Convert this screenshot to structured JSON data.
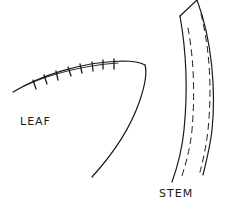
{
  "diagram": {
    "type": "hand-drawn sketch",
    "stroke_color": "#1a1a1a",
    "background_color": "#ffffff",
    "parts": [
      {
        "id": "leaf",
        "label": "LEAF"
      },
      {
        "id": "stem",
        "label": "STEM"
      }
    ]
  },
  "labels": {
    "leaf": "LEAF",
    "stem": "STEM"
  }
}
